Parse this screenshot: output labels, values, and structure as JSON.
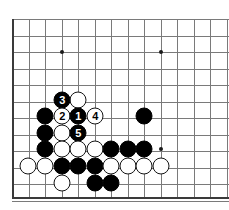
{
  "figure": {
    "kind": "go-board-diagram",
    "width": 229,
    "height": 210
  },
  "board": {
    "background_color": "#ffffff",
    "grid_color": "#7a7a7a",
    "edge_color": "#3a3a3a",
    "origin_x": 12,
    "origin_y": 19,
    "spacing": 16.5,
    "columns": 14,
    "rows": 12,
    "left_edge": true,
    "bottom_edge": true,
    "star_points": [
      {
        "name": "star-point-upper-left",
        "x": 62,
        "y": 52
      },
      {
        "name": "star-point-upper-right",
        "x": 161,
        "y": 52
      },
      {
        "name": "star-point-lower-right",
        "x": 161,
        "y": 149
      }
    ]
  },
  "stones": [
    {
      "name": "white-stone-d-top",
      "color": "white",
      "label": "",
      "x": 78,
      "y": 100
    },
    {
      "name": "black-stone-move-3",
      "color": "black",
      "label": "3",
      "x": 62,
      "y": 100
    },
    {
      "name": "black-stone-left-1",
      "color": "black",
      "label": "",
      "x": 45,
      "y": 116
    },
    {
      "name": "white-stone-move-2",
      "color": "white",
      "label": "2",
      "x": 62,
      "y": 116
    },
    {
      "name": "black-stone-move-1",
      "color": "black",
      "label": "1",
      "x": 78,
      "y": 116
    },
    {
      "name": "white-stone-move-4",
      "color": "white",
      "label": "4",
      "x": 95,
      "y": 116
    },
    {
      "name": "black-stone-right-isolated",
      "color": "black",
      "label": "",
      "x": 144,
      "y": 116
    },
    {
      "name": "black-stone-left-2",
      "color": "black",
      "label": "",
      "x": 45,
      "y": 133
    },
    {
      "name": "white-stone-center-1",
      "color": "white",
      "label": "",
      "x": 62,
      "y": 133
    },
    {
      "name": "black-stone-move-5",
      "color": "black",
      "label": "5",
      "x": 78,
      "y": 133
    },
    {
      "name": "black-stone-left-3",
      "color": "black",
      "label": "",
      "x": 45,
      "y": 149
    },
    {
      "name": "white-stone-row4-1",
      "color": "white",
      "label": "",
      "x": 62,
      "y": 149
    },
    {
      "name": "white-stone-row4-2",
      "color": "white",
      "label": "",
      "x": 78,
      "y": 149
    },
    {
      "name": "white-stone-row4-3",
      "color": "white",
      "label": "",
      "x": 95,
      "y": 149
    },
    {
      "name": "black-stone-row4-1",
      "color": "black",
      "label": "",
      "x": 111,
      "y": 149
    },
    {
      "name": "black-stone-row4-2",
      "color": "black",
      "label": "",
      "x": 128,
      "y": 149
    },
    {
      "name": "black-stone-row4-3",
      "color": "black",
      "label": "",
      "x": 144,
      "y": 149
    },
    {
      "name": "white-stone-row5-1",
      "color": "white",
      "label": "",
      "x": 28,
      "y": 166
    },
    {
      "name": "white-stone-row5-2",
      "color": "white",
      "label": "",
      "x": 45,
      "y": 166
    },
    {
      "name": "black-stone-row5-1",
      "color": "black",
      "label": "",
      "x": 62,
      "y": 166
    },
    {
      "name": "black-stone-row5-2",
      "color": "black",
      "label": "",
      "x": 78,
      "y": 166
    },
    {
      "name": "black-stone-row5-3",
      "color": "black",
      "label": "",
      "x": 95,
      "y": 166
    },
    {
      "name": "white-stone-row5-3",
      "color": "white",
      "label": "",
      "x": 111,
      "y": 166
    },
    {
      "name": "white-stone-row5-4",
      "color": "white",
      "label": "",
      "x": 128,
      "y": 166
    },
    {
      "name": "white-stone-row5-5",
      "color": "white",
      "label": "",
      "x": 144,
      "y": 166
    },
    {
      "name": "white-stone-row5-6",
      "color": "white",
      "label": "",
      "x": 161,
      "y": 166
    },
    {
      "name": "white-stone-row6-1",
      "color": "white",
      "label": "",
      "x": 62,
      "y": 183
    },
    {
      "name": "black-stone-row6-1",
      "color": "black",
      "label": "",
      "x": 95,
      "y": 183
    },
    {
      "name": "black-stone-row6-2",
      "color": "black",
      "label": "",
      "x": 111,
      "y": 183
    }
  ],
  "move_sequence": [
    {
      "number": "1",
      "color": "black"
    },
    {
      "number": "2",
      "color": "white"
    },
    {
      "number": "3",
      "color": "black"
    },
    {
      "number": "4",
      "color": "white"
    },
    {
      "number": "5",
      "color": "black"
    }
  ]
}
